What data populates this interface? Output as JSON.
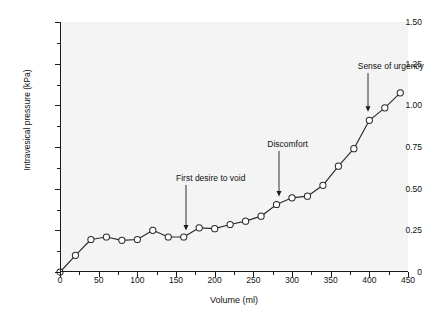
{
  "chart_data": {
    "type": "line",
    "title": "",
    "xlabel": "Volume (ml)",
    "ylabel": "Intravesical pressure (kPa)",
    "xlim": [
      0,
      450
    ],
    "ylim": [
      0,
      1.5
    ],
    "xticks": [
      0,
      50,
      100,
      150,
      200,
      250,
      300,
      350,
      400,
      450
    ],
    "xtick_labels": [
      "0",
      "50",
      "100",
      "150",
      "200",
      "250",
      "300",
      "350",
      "400",
      "450"
    ],
    "yticks": [
      0,
      0.25,
      0.5,
      0.75,
      1.0,
      1.25,
      1.5
    ],
    "ytick_labels": [
      "0",
      "0.25",
      "0.50",
      "0.75",
      "1.00",
      "1.25",
      "1.50"
    ],
    "y_minor_ticks": [
      0.125,
      0.375,
      0.625,
      0.875,
      1.125,
      1.375
    ],
    "x_minor_ticks": [
      25,
      75,
      125,
      175,
      225,
      275,
      325,
      375,
      425
    ],
    "grid": false,
    "legend": null,
    "marker": "open-circle",
    "line_color": "#2b2b2b",
    "marker_face_color": "#ffffff",
    "plot_background": "#f4f4f4",
    "x": [
      0,
      20,
      40,
      60,
      80,
      100,
      120,
      140,
      160,
      180,
      200,
      220,
      240,
      260,
      280,
      300,
      320,
      340,
      360,
      380,
      400,
      420,
      440
    ],
    "values": [
      0.0,
      0.1,
      0.195,
      0.21,
      0.19,
      0.195,
      0.25,
      0.21,
      0.21,
      0.265,
      0.26,
      0.285,
      0.305,
      0.335,
      0.405,
      0.445,
      0.455,
      0.52,
      0.635,
      0.74,
      0.91,
      0.985,
      1.075
    ],
    "series": [
      {
        "name": "Cystometrogram",
        "values": [
          0.0,
          0.1,
          0.195,
          0.21,
          0.19,
          0.195,
          0.25,
          0.21,
          0.21,
          0.265,
          0.26,
          0.285,
          0.305,
          0.335,
          0.405,
          0.445,
          0.455,
          0.52,
          0.635,
          0.74,
          0.91,
          0.985,
          1.075
        ]
      }
    ],
    "annotations": [
      {
        "text": "First desire to void",
        "x": 163,
        "y": 0.215,
        "label_x": 150,
        "label_y": 0.56
      },
      {
        "text": "Discomfort",
        "x": 283,
        "y": 0.415,
        "label_x": 268,
        "label_y": 0.76
      },
      {
        "text": "Sense of urgency",
        "x": 398,
        "y": 0.925,
        "label_x": 385,
        "label_y": 1.23
      }
    ]
  }
}
